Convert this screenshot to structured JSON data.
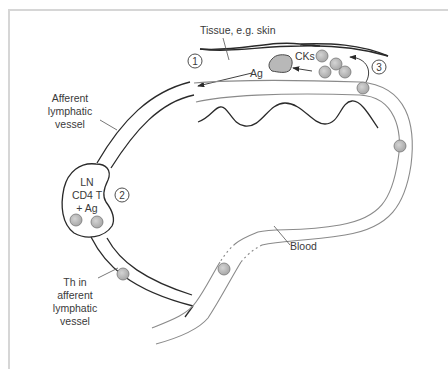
{
  "diagram": {
    "labels": {
      "tissue": "Tissue, e.g. skin",
      "ag": "Ag",
      "cks": "CKs",
      "afferent_1": "Afferent",
      "afferent_2": "lymphatic",
      "afferent_3": "vessel",
      "ln_1": "LN",
      "ln_2": "CD4 T",
      "ln_3": "+ Ag",
      "th_1": "Th in",
      "th_2": "afferent",
      "th_3": "lymphatic",
      "th_4": "vessel",
      "blood": "Blood"
    },
    "steps": [
      "1",
      "2",
      "3"
    ],
    "colors": {
      "dark_line": "#2a2a2a",
      "blood_line": "#8a8a8a",
      "cell_fill": "#b8b8b8",
      "frame": "#d6d6d6"
    }
  }
}
